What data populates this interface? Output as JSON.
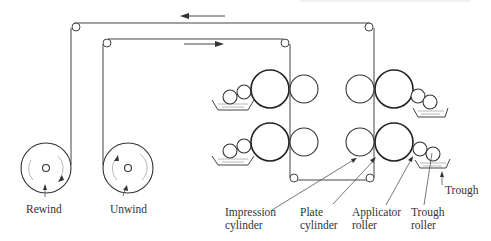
{
  "diagram": {
    "type": "flexographic printing press web path",
    "direction_arrows": [
      {
        "id": "top-arrow",
        "direction": "left"
      },
      {
        "id": "inner-arrow",
        "direction": "right"
      }
    ],
    "reels": [
      {
        "id": "rewind",
        "label": "Rewind"
      },
      {
        "id": "unwind",
        "label": "Unwind"
      }
    ],
    "labels": {
      "impression_cylinder": [
        "Impression",
        "cylinder"
      ],
      "plate_cylinder": [
        "Plate",
        "cylinder"
      ],
      "applicator_roller": [
        "Applicator",
        "roller"
      ],
      "trough_roller": [
        "Trough",
        "roller"
      ],
      "trough": "Trough"
    },
    "colors": {
      "line": "#444444",
      "text": "#333333",
      "background": "#ffffff"
    }
  }
}
